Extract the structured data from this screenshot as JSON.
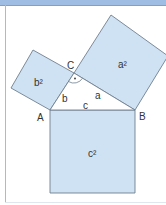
{
  "diagram": {
    "colors": {
      "square_fill": "#cfe2f3",
      "stroke": "#6f7f8f",
      "header": "#9fbce3",
      "text": "#333333"
    },
    "vertices": {
      "A": {
        "label": "A",
        "x": 50,
        "y": 110
      },
      "B": {
        "label": "B",
        "x": 135,
        "y": 110
      },
      "C": {
        "label": "C",
        "x": 74,
        "y": 73
      }
    },
    "sides": {
      "a": "a",
      "b": "b",
      "c": "c"
    },
    "squares": {
      "a2": "a²",
      "b2": "b²",
      "c2": "c²"
    },
    "right_angle_marker": "·"
  }
}
